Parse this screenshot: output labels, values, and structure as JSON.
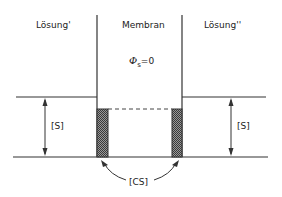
{
  "diagram": {
    "regions": {
      "left": {
        "label": "Lösung'"
      },
      "middle": {
        "label": "Membran"
      },
      "right": {
        "label": "Lösung''"
      }
    },
    "membrane_potential": {
      "symbol": "Φ",
      "subscript": "s",
      "equals": "=0"
    },
    "concentration_labels": {
      "left": "[S]",
      "right": "[S]",
      "complex": "[CS]"
    },
    "colors": {
      "line": "#333333",
      "hatch": "#555555",
      "background": "#ffffff"
    }
  }
}
